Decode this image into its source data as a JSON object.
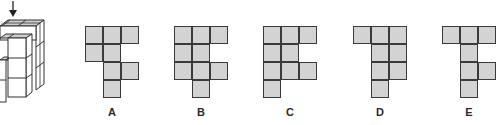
{
  "puzzle": {
    "view_arrow": "down-arrow",
    "cell_color": "#d3d3d3",
    "line_color": "#3a3a3a",
    "options": [
      {
        "label": "A",
        "x": 85,
        "cells": [
          [
            0,
            0
          ],
          [
            0,
            1
          ],
          [
            0,
            2
          ],
          [
            1,
            0
          ],
          [
            1,
            1
          ],
          [
            2,
            1
          ],
          [
            2,
            2
          ],
          [
            3,
            1
          ]
        ]
      },
      {
        "label": "B",
        "x": 174,
        "cells": [
          [
            0,
            0
          ],
          [
            0,
            1
          ],
          [
            0,
            2
          ],
          [
            1,
            0
          ],
          [
            1,
            1
          ],
          [
            2,
            0
          ],
          [
            2,
            1
          ],
          [
            2,
            2
          ],
          [
            3,
            1
          ]
        ]
      },
      {
        "label": "C",
        "x": 263,
        "cells": [
          [
            0,
            0
          ],
          [
            0,
            1
          ],
          [
            0,
            2
          ],
          [
            1,
            0
          ],
          [
            1,
            1
          ],
          [
            2,
            0
          ],
          [
            2,
            1
          ],
          [
            2,
            2
          ],
          [
            3,
            0
          ]
        ]
      },
      {
        "label": "D",
        "x": 353,
        "cells": [
          [
            0,
            0
          ],
          [
            0,
            1
          ],
          [
            0,
            2
          ],
          [
            1,
            1
          ],
          [
            1,
            2
          ],
          [
            2,
            1
          ],
          [
            2,
            2
          ],
          [
            3,
            1
          ]
        ]
      },
      {
        "label": "E",
        "x": 442,
        "cells": [
          [
            0,
            0
          ],
          [
            0,
            1
          ],
          [
            0,
            2
          ],
          [
            1,
            1
          ],
          [
            2,
            1
          ],
          [
            2,
            2
          ],
          [
            3,
            1
          ]
        ]
      }
    ]
  }
}
